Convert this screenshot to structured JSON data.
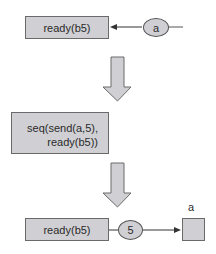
{
  "diagram": {
    "step1": {
      "process_label": "ready(b5)",
      "message_label": "a"
    },
    "step2": {
      "process_line1": "seq(send(a,5),",
      "process_line2": "ready(b5))"
    },
    "step3": {
      "process_label": "ready(b5)",
      "message_label": "5",
      "channel_label": "a"
    },
    "colors": {
      "fill": "#d0d0d4",
      "stroke": "#555555",
      "background": "#ffffff"
    }
  }
}
